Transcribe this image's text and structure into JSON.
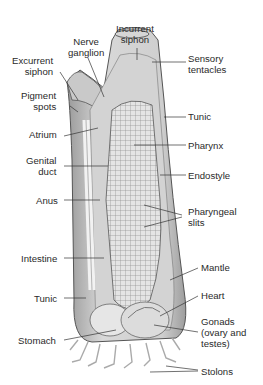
{
  "diagram": {
    "colors": {
      "ink": "#2a2a2a",
      "tissue_light": "#e6e6e6",
      "tissue_mid": "#bdbdbd",
      "tissue_dark": "#8a8a8a",
      "background": "#ffffff"
    },
    "labels": {
      "incurrent_siphon": "Incurrent\nsiphon",
      "nerve_ganglion": "Nerve\nganglion",
      "excurrent_siphon": "Excurrent\nsiphon",
      "sensory_tentacles": "Sensory\ntentacles",
      "pigment_spots": "Pigment\nspots",
      "tunic_top": "Tunic",
      "atrium": "Atrium",
      "pharynx": "Pharynx",
      "genital_duct": "Genital\nduct",
      "endostyle": "Endostyle",
      "anus": "Anus",
      "pharyngeal_slits": "Pharyngeal\nslits",
      "intestine": "Intestine",
      "mantle": "Mantle",
      "tunic_bottom": "Tunic",
      "heart": "Heart",
      "gonads": "Gonads\n(ovary and\ntestes)",
      "stomach": "Stomach",
      "stolons": "Stolons"
    }
  }
}
